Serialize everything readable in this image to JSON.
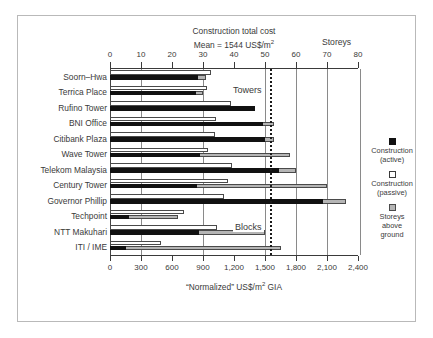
{
  "chart_data": {
    "type": "bar",
    "orientation": "horizontal",
    "title": "Construction total cost",
    "subtitle": "Mean = 1544 US$/m2",
    "mean_value": 1544,
    "secondary_axis_title": "Storeys",
    "xlabel": "\"Normalized\" US$/m2 GIA",
    "ylabel": "",
    "grid": true,
    "legend_position": "right",
    "categories": [
      "Soorn–Hwa",
      "Terrica Place",
      "Rufino Tower",
      "BNI Office",
      "Citibank Plaza",
      "Wave Tower",
      "Telekom Malaysia",
      "Century Tower",
      "Governor Phillip",
      "Techpoint",
      "NTT Makuhari",
      "ITI / IME"
    ],
    "series": [
      {
        "name": "Construction (active)",
        "color": "#111111",
        "unit": "US$/m2",
        "values": [
          850,
          830,
          1400,
          1480,
          1500,
          870,
          1640,
          840,
          2060,
          180,
          860,
          150
        ]
      },
      {
        "name": "Construction (passive)",
        "color": "#ffffff",
        "unit": "US$/m2",
        "values": [
          980,
          940,
          1170,
          1030,
          1020,
          950,
          1180,
          1140,
          1100,
          720,
          1040,
          490
        ]
      },
      {
        "name": "Storeys above ground",
        "color": "#b5b5b5",
        "unit": "storeys",
        "values": [
          31,
          30,
          12,
          53,
          53,
          58,
          60,
          70,
          76,
          22,
          50,
          55
        ]
      }
    ],
    "axis_bottom": {
      "label": "\"Normalized\" US$/m2 GIA",
      "min": 0,
      "max": 2400,
      "step": 300,
      "ticks": [
        "0",
        "300",
        "600",
        "900",
        "1,200",
        "1,500",
        "1,800",
        "2,100",
        "2,400"
      ]
    },
    "axis_top": {
      "label": "Storeys",
      "min": 0,
      "max": 80,
      "step": 10,
      "ticks": [
        "0",
        "10",
        "20",
        "30",
        "40",
        "50",
        "60",
        "70",
        "80"
      ]
    },
    "gridline_values": [
      300,
      900,
      1500,
      1800,
      2100
    ],
    "annotations": [
      {
        "text": "Towers",
        "value": 1560,
        "group_rows": "Soorn-Hwa..Governor Phillip"
      },
      {
        "text": "Blocks",
        "value": 1560,
        "group_rows": "Techpoint..ITI / IME"
      }
    ],
    "legend": [
      {
        "label_line1": "Construction",
        "label_line2": "(active)",
        "swatch": "black"
      },
      {
        "label_line1": "Construction",
        "label_line2": "(passive)",
        "swatch": "white"
      },
      {
        "label_line1": "Storeys",
        "label_line2": "above",
        "label_line3": "ground",
        "swatch": "gray"
      }
    ]
  },
  "title": {
    "line1": "Construction total cost",
    "line2_prefix": "Mean = 1544 US$/m",
    "line2_sup": "2"
  },
  "storeys_title": "Storeys",
  "x_caption": {
    "prefix": "“Normalized” US$/m",
    "sup": "2",
    "suffix": " GIA"
  },
  "region_labels": {
    "towers": "Towers",
    "blocks": "Blocks"
  },
  "legend": {
    "active_line1": "Construction",
    "active_line2": "(active)",
    "passive_line1": "Construction",
    "passive_line2": "(passive)",
    "storeys_line1": "Storeys",
    "storeys_line2": "above",
    "storeys_line3": "ground"
  }
}
